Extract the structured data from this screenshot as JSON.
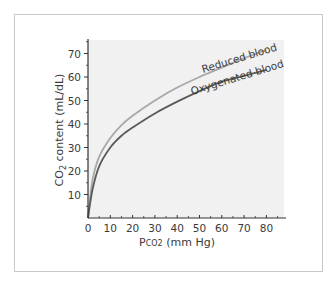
{
  "chart_data": {
    "type": "line",
    "title": "",
    "xlabel": "PCO2 (mm Hg)",
    "xlabel_main": "P",
    "xlabel_sub": "CO2",
    "xlabel_rest": " (mm Hg)",
    "ylabel": "CO2 content (mL/dL)",
    "ylabel_main": "CO",
    "ylabel_sub": "2",
    "ylabel_rest": " content (mL/dL)",
    "xlim": [
      0,
      86
    ],
    "ylim": [
      0,
      75
    ],
    "x_ticks": [
      0,
      10,
      20,
      30,
      40,
      50,
      60,
      70,
      80
    ],
    "x_tick_labels": [
      "0",
      "10",
      "20",
      "30",
      "40",
      "50",
      "60",
      "70",
      "80"
    ],
    "y_ticks": [
      10,
      20,
      30,
      40,
      50,
      60,
      70
    ],
    "y_tick_labels": [
      "10",
      "20",
      "30",
      "40",
      "50",
      "60",
      "70"
    ],
    "grid": false,
    "legend": "inline labels along curves",
    "plot_background": "#f1f1f1",
    "series": [
      {
        "name": "Reduced blood",
        "color": "#a8a8a8",
        "x": [
          0,
          2,
          5,
          10,
          15,
          20,
          30,
          40,
          50,
          60,
          70,
          80
        ],
        "y": [
          0,
          16,
          26,
          34,
          39.5,
          43.5,
          50,
          55.5,
          60,
          64,
          68,
          71.5
        ]
      },
      {
        "name": "Oxygenated blood",
        "color": "#5a5a5a",
        "x": [
          0,
          2,
          5,
          10,
          15,
          20,
          30,
          40,
          50,
          60,
          70,
          80
        ],
        "y": [
          0,
          12,
          22,
          30,
          35,
          38.5,
          44.5,
          49.5,
          54,
          58,
          60.5,
          63
        ]
      }
    ]
  }
}
